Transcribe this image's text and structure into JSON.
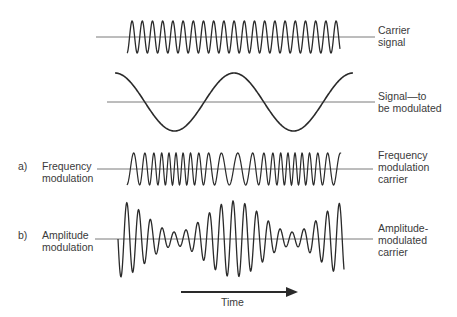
{
  "figure": {
    "rows": [
      {
        "id": "carrier",
        "left_label": "",
        "left_marker": "",
        "right_label_lines": [
          "Carrier",
          "signal"
        ]
      },
      {
        "id": "modulating",
        "left_label": "",
        "left_marker": "",
        "right_label_lines": [
          "Signal—to",
          "be modulated"
        ]
      },
      {
        "id": "fm",
        "left_marker": "a)",
        "left_label_lines": [
          "Frequency",
          "modulation"
        ],
        "right_label_lines": [
          "Frequency",
          "modulation",
          "carrier"
        ]
      },
      {
        "id": "am",
        "left_marker": "b)",
        "left_label_lines": [
          "Amplitude",
          "modulation"
        ],
        "right_label_lines": [
          "Amplitude-",
          "modulated",
          "carrier"
        ]
      }
    ],
    "time_axis": {
      "label": "Time",
      "direction": "right"
    },
    "colors": {
      "wave": "#2a2a2a",
      "baseline": "#7a7a7a",
      "text": "#3a3a3a"
    }
  }
}
